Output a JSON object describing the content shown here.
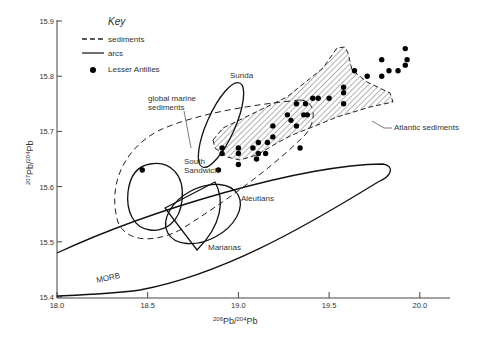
{
  "chart_data": {
    "type": "scatter",
    "title": "",
    "xlabel": "206Pb/204Pb",
    "ylabel": "207Pb/204Pb",
    "xlim": [
      18.0,
      20.3
    ],
    "ylim": [
      15.4,
      15.9
    ],
    "x_ticks": [
      "18.0",
      "18.5",
      "19.0",
      "19.5",
      "20.0"
    ],
    "y_ticks": [
      "15.4",
      "15.5",
      "15.6",
      "15.7",
      "15.8",
      "15.9"
    ],
    "grid": false,
    "legend": {
      "title": "Key",
      "position": "upper-left",
      "entries": [
        {
          "label": "sediments",
          "style": "dashed-line"
        },
        {
          "label": "arcs",
          "style": "solid-line"
        },
        {
          "label": "Lesser Antilles",
          "style": "filled-circle"
        }
      ]
    },
    "series": [
      {
        "name": "Lesser Antilles",
        "marker": "filled-circle",
        "points": [
          [
            18.47,
            15.63
          ],
          [
            18.89,
            15.63
          ],
          [
            18.91,
            15.66
          ],
          [
            18.91,
            15.67
          ],
          [
            19.0,
            15.64
          ],
          [
            19.0,
            15.66
          ],
          [
            19.0,
            15.67
          ],
          [
            19.08,
            15.67
          ],
          [
            19.1,
            15.65
          ],
          [
            19.11,
            15.66
          ],
          [
            19.11,
            15.68
          ],
          [
            19.15,
            15.66
          ],
          [
            19.16,
            15.68
          ],
          [
            19.19,
            15.69
          ],
          [
            19.19,
            15.71
          ],
          [
            19.27,
            15.73
          ],
          [
            19.29,
            15.72
          ],
          [
            19.32,
            15.71
          ],
          [
            19.34,
            15.67
          ],
          [
            19.32,
            15.75
          ],
          [
            19.36,
            15.73
          ],
          [
            19.38,
            15.73
          ],
          [
            19.37,
            15.75
          ],
          [
            19.41,
            15.76
          ],
          [
            19.44,
            15.76
          ],
          [
            19.5,
            15.76
          ],
          [
            19.58,
            15.75
          ],
          [
            19.58,
            15.77
          ],
          [
            19.58,
            15.78
          ],
          [
            19.64,
            15.81
          ],
          [
            19.71,
            15.8
          ],
          [
            19.79,
            15.83
          ],
          [
            19.79,
            15.8
          ],
          [
            19.83,
            15.81
          ],
          [
            19.88,
            15.81
          ],
          [
            19.92,
            15.82
          ],
          [
            19.93,
            15.83
          ],
          [
            19.92,
            15.85
          ]
        ]
      },
      {
        "name": "global marine sediments",
        "style": "dashed-outline"
      },
      {
        "name": "Atlantic sediments",
        "style": "hatched-field-dashed-outline"
      },
      {
        "name": "Sunda",
        "style": "solid-outline",
        "approx_range": {
          "x": [
            18.85,
            19.07
          ],
          "y": [
            15.63,
            15.79
          ]
        }
      },
      {
        "name": "South Sandwich",
        "style": "solid-outline",
        "approx_range": {
          "x": [
            18.4,
            18.72
          ],
          "y": [
            15.52,
            15.64
          ]
        }
      },
      {
        "name": "Aleutians",
        "style": "solid-outline",
        "approx_range": {
          "x": [
            18.62,
            19.0
          ],
          "y": [
            15.49,
            15.61
          ]
        }
      },
      {
        "name": "Marianas",
        "style": "solid-outline",
        "approx_range": {
          "x": [
            18.6,
            18.92
          ],
          "y": [
            15.48,
            15.61
          ]
        }
      },
      {
        "name": "MORB",
        "style": "solid-outline",
        "approx_range": {
          "x": [
            18.0,
            20.02
          ],
          "y": [
            15.4,
            15.63
          ]
        }
      }
    ],
    "annotations": [
      {
        "text": "Sunda"
      },
      {
        "text": "global marine sediments"
      },
      {
        "text": "South Sandwich"
      },
      {
        "text": "Atlantic sediments"
      },
      {
        "text": "Aleutians"
      },
      {
        "text": "Marianas"
      },
      {
        "text": "MORB"
      }
    ]
  },
  "labels": {
    "key_title": "Key",
    "key_sediments": "sediments",
    "key_arcs": "arcs",
    "key_lesser": "Lesser Antilles",
    "sunda": "Sunda",
    "gms_line1": "global marine",
    "gms_line2": "sediments",
    "ss_line1": "South",
    "ss_line2": "Sandwich",
    "atlantic": "Atlantic sediments",
    "aleutians": "Aleutians",
    "marianas": "Marianas",
    "morb": "MORB",
    "x_pre": "206",
    "x_mid": "Pb/",
    "x_sup2": "204",
    "x_end": "Pb",
    "y_pre": "207",
    "y_mid": "Pb/",
    "y_sup2": "204",
    "y_end": "Pb"
  }
}
